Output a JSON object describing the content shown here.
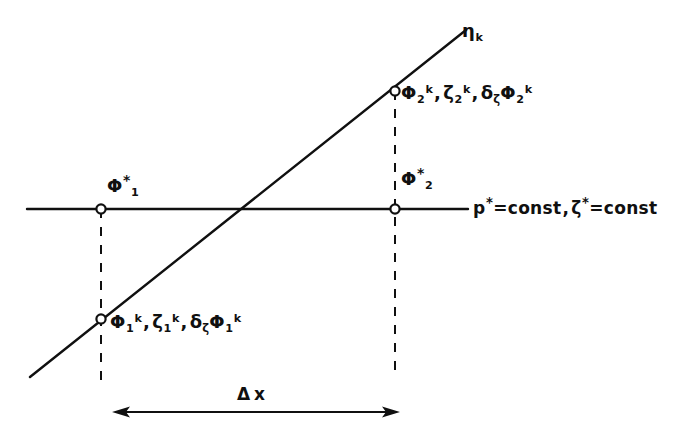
{
  "figure": {
    "background_color": "#ffffff",
    "line_color": "#101010",
    "node_fill": "#ffffff"
  },
  "labels": {
    "eta_line": {
      "symbol": "η",
      "sub": "k"
    },
    "node_upper_right": {
      "term1": {
        "symbol": "Φ",
        "sub": "2",
        "sup": "k"
      },
      "term2": {
        "symbol": "ζ",
        "sub": "2",
        "sup": "k"
      },
      "term3": {
        "op": "δ",
        "op_sub": "ζ",
        "symbol": "Φ",
        "sub": "2",
        "sup": "k"
      },
      "separator": ","
    },
    "node_lower_left": {
      "term1": {
        "symbol": "Φ",
        "sub": "1",
        "sup": "k"
      },
      "term2": {
        "symbol": "ζ",
        "sub": "1",
        "sup": "k"
      },
      "term3": {
        "op": "δ",
        "op_sub": "ζ",
        "symbol": "Φ",
        "sub": "1",
        "sup": "k"
      },
      "separator": ","
    },
    "phi1_star": {
      "symbol": "Φ",
      "sub": "1",
      "sup": "*"
    },
    "phi2_star": {
      "symbol": "Φ",
      "sub": "2",
      "sup": "*"
    },
    "horizontal_line": {
      "part1_symbol": "p",
      "part1_sup": "*",
      "part1_value": "=const",
      "separator": ",",
      "part2_symbol": "ζ",
      "part2_sup": "*",
      "part2_value": "=const"
    },
    "delta_x": {
      "delta": "Δ",
      "variable": "x"
    }
  },
  "geometry": {
    "horizontal_line": {
      "x1": 27,
      "y1": 209,
      "x2": 468,
      "y2": 209
    },
    "diagonal_line": {
      "x1": 30,
      "y1": 377,
      "x2": 466,
      "y2": 30
    },
    "dashed_left": {
      "x": 101,
      "y_top": 209,
      "y_bottom": 385
    },
    "dashed_right": {
      "x": 395,
      "y_top": 91,
      "y_bottom": 374
    },
    "nodes": [
      {
        "name": "phi1-star-node",
        "cx": 101,
        "cy": 209
      },
      {
        "name": "phi2-star-node",
        "cx": 395,
        "cy": 209
      },
      {
        "name": "node-lower-left",
        "cx": 101,
        "cy": 319
      },
      {
        "name": "node-upper-right",
        "cx": 395,
        "cy": 91
      }
    ],
    "delta_arrow": {
      "x1": 112,
      "x2": 400,
      "y": 412
    }
  }
}
